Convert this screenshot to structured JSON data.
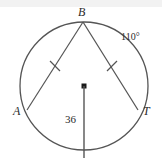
{
  "figure": {
    "kind": "circle-geometry-diagram",
    "colors": {
      "stroke": "#555555",
      "text": "#2b2b2b",
      "background": "#ffffff",
      "band": "#f2f2f2"
    },
    "circle": {
      "center_x": 84,
      "center_y": 86,
      "radius": 64
    },
    "points": {
      "B": {
        "label": "B",
        "x": 83,
        "y": 22
      },
      "A": {
        "label": "A",
        "x": 27,
        "y": 110
      },
      "T": {
        "label": "T",
        "x": 138,
        "y": 110
      },
      "center": {
        "label": "",
        "x": 84,
        "y": 86
      }
    },
    "chords": [
      {
        "name": "chord-BA",
        "from": "B",
        "to": "A",
        "tick_marks": 1
      },
      {
        "name": "chord-BT",
        "from": "B",
        "to": "T",
        "tick_marks": 1
      }
    ],
    "radius_segment": {
      "name": "radius-segment",
      "from_x": 84,
      "from_y": 86,
      "to_x": 84,
      "to_y": 158,
      "label": "36"
    },
    "arc_label": {
      "name": "arc-angle-label",
      "text": "110°"
    }
  }
}
